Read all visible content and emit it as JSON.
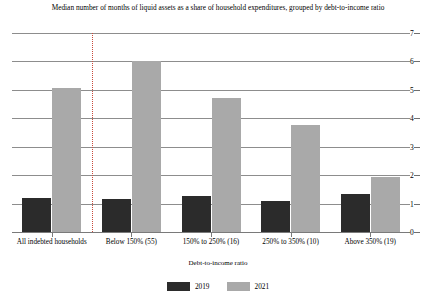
{
  "chart_data": {
    "type": "bar",
    "title": "Median number of months of liquid assets as a share of household expenditures,  grouped by debt-to-income ratio",
    "xlabel": "Debt-to-income ratio",
    "ylabel": "",
    "ylim": [
      0,
      7
    ],
    "yticks": [
      0,
      1,
      2,
      3,
      4,
      5,
      6,
      7
    ],
    "ytick_labels": [
      "0",
      "1",
      "2",
      "3",
      "4",
      "5",
      "6",
      "7"
    ],
    "grid": true,
    "y_axis_position": "right",
    "legend_position": "bottom",
    "categories": [
      "All indebted households",
      "Below 150%  (55)",
      "150% to 250%  (16)",
      "250% to 350%  (10)",
      "Above 350%  (19)"
    ],
    "series": [
      {
        "name": "2019",
        "color": "#2b2b2b",
        "values": [
          1.2,
          1.17,
          1.25,
          1.1,
          1.35
        ]
      },
      {
        "name": "2021",
        "color": "#a9a9a9",
        "values": [
          5.05,
          6.0,
          4.7,
          3.75,
          1.95
        ]
      }
    ],
    "annotations": [
      {
        "type": "vertical-dotted-divider",
        "after_category_index": 0,
        "color": "#c94a3a"
      }
    ]
  },
  "legend": {
    "items": [
      {
        "label": "2019"
      },
      {
        "label": "2021"
      }
    ]
  },
  "colors": {
    "series_2019": "#2b2b2b",
    "series_2021": "#a9a9a9",
    "gridline": "#8d8d8d",
    "divider": "#c94a3a",
    "background": "#ffffff"
  }
}
